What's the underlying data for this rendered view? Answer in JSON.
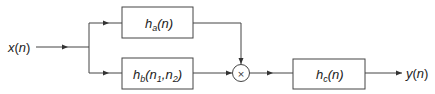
{
  "diagram": {
    "type": "block-diagram",
    "input": {
      "label": "x(n)",
      "base": "x",
      "arg": "n"
    },
    "output": {
      "label": "y(n)",
      "base": "y",
      "arg": "n"
    },
    "blocks": [
      {
        "id": "ha",
        "base": "h",
        "sub": "a",
        "arg": "(n)"
      },
      {
        "id": "hb",
        "base": "h",
        "sub": "b",
        "arg_open": "(",
        "n1": "n",
        "n1_sub": "1",
        "sep": ",",
        "n2": "n",
        "n2_sub": "2",
        "arg_close": ")"
      },
      {
        "id": "hc",
        "base": "h",
        "sub": "c",
        "arg": "(n)"
      }
    ],
    "multiplier": {
      "symbol": "×"
    },
    "connections": [
      "x(n) -> ha",
      "x(n) -> hb",
      "ha -> multiplier",
      "hb -> multiplier",
      "multiplier -> hc",
      "hc -> y(n)"
    ]
  }
}
